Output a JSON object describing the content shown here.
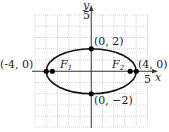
{
  "diagram": {
    "type": "ellipse-graph",
    "axes": {
      "x_label": "x",
      "y_label": "y",
      "x_tick_label": "5",
      "y_tick_label": "5"
    },
    "ellipse": {
      "center": [
        0,
        0
      ],
      "a": 4,
      "b": 2
    },
    "points": [
      {
        "label": "(-4, 0)",
        "x": -4,
        "y": 0
      },
      {
        "label": "(4, 0)",
        "x": 4,
        "y": 0
      },
      {
        "label": "(0, 2)",
        "x": 0,
        "y": 2
      },
      {
        "label": "(0, −2)",
        "x": 0,
        "y": -2
      }
    ],
    "foci": [
      {
        "name": "F",
        "sub": "1",
        "x": -3.46,
        "y": 0
      },
      {
        "name": "F",
        "sub": "2",
        "x": 3.46,
        "y": 0
      }
    ],
    "colors": {
      "grid": "#b0b0b0",
      "axis": "#333333",
      "curve": "#111111",
      "point": "#000000"
    }
  }
}
